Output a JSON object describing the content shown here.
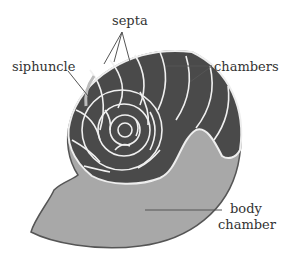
{
  "diagram": {
    "type": "nautilus shell cross-section",
    "labels": {
      "septa": "septa",
      "siphuncle": "siphuncle",
      "chambers": "chambers",
      "body_line1": "body",
      "body_line2": "chamber"
    },
    "colors": {
      "chambers_fill": "#4a4a4a",
      "body_fill": "#a8a8a8",
      "septa_stroke": "#f0f0f0",
      "outline": "#555555"
    }
  }
}
